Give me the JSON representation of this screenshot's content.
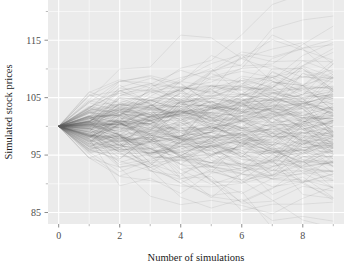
{
  "chart_data": {
    "type": "line",
    "title": "",
    "subtitle": "",
    "xlabel": "Number of simulations",
    "ylabel": "Simulated stock prices",
    "xlim": [
      -0.35,
      9.35
    ],
    "ylim": [
      83.0,
      122.0
    ],
    "xticks": [
      0,
      2,
      4,
      6,
      8
    ],
    "xtick_labels": [
      "0",
      "2",
      "4",
      "6",
      "8"
    ],
    "yticks": [
      85,
      95,
      105,
      115
    ],
    "ytick_labels": [
      "85",
      "95",
      "105",
      "115"
    ],
    "minor_xticks": [
      1,
      3,
      5,
      7,
      9
    ],
    "minor_yticks": [
      90,
      100,
      110,
      120
    ],
    "grid": true,
    "grid_color": "#ffffff",
    "panel_background": "#ebebeb",
    "figure_background": "#ffffff",
    "legend": null,
    "legend_position": "none",
    "annotations": [],
    "line_color": "#595959",
    "line_opacity": 0.22,
    "line_width": 0.5,
    "n_series": 200,
    "n_steps": 9,
    "x": [
      0,
      1,
      2,
      3,
      4,
      5,
      6,
      7,
      8,
      9
    ],
    "start_value": 100,
    "series_summary": {
      "start": 100,
      "final_min": 84.0,
      "final_max": 117.0,
      "final_median": 100.2,
      "final_p05": 90.5,
      "final_p95": 110.0
    }
  },
  "axes": {
    "x_title": "Number of simulations",
    "y_title": "Simulated stock prices"
  }
}
